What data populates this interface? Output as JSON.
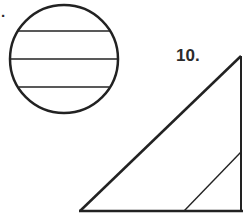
{
  "worksheet": {
    "problems": [
      {
        "label": ".",
        "figure": "circle",
        "description": "Circle divided by three parallel horizontal chords"
      },
      {
        "label": "10.",
        "figure": "right-triangle",
        "description": "Right triangle with a segment parallel to the hypotenuse"
      }
    ]
  },
  "colors": {
    "stroke": "#222222",
    "background": "#ffffff",
    "label": "#2b2b2b"
  }
}
